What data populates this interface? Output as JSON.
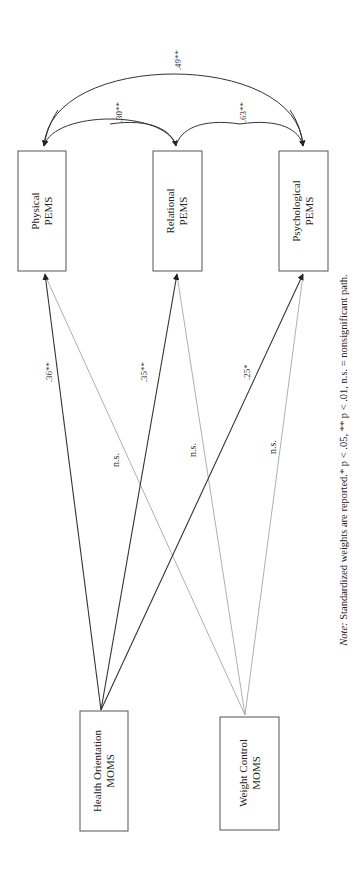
{
  "diagram": {
    "orientation": "rotated-90-ccw",
    "outcomes": [
      {
        "id": "physical",
        "line1": "Physical",
        "line2": "PEMS"
      },
      {
        "id": "relational",
        "line1": "Relational",
        "line2": "PEMS"
      },
      {
        "id": "psychological",
        "line1": "Psychological",
        "line2": "PEMS"
      }
    ],
    "predictors": [
      {
        "id": "health",
        "line1": "Health Orientation",
        "line2": "MOMS"
      },
      {
        "id": "weight",
        "line1": "Weight Control",
        "line2": "MOMS"
      }
    ],
    "paths": [
      {
        "from": "health",
        "to": "physical",
        "label": ".36**",
        "significant": true
      },
      {
        "from": "health",
        "to": "relational",
        "label": ".35**",
        "significant": true
      },
      {
        "from": "health",
        "to": "psychological",
        "label": ".25*",
        "significant": true
      },
      {
        "from": "weight",
        "to": "physical",
        "label": "n.s.",
        "significant": false
      },
      {
        "from": "weight",
        "to": "relational",
        "label": "n.s.",
        "significant": false
      },
      {
        "from": "weight",
        "to": "psychological",
        "label": "n.s.",
        "significant": false
      }
    ],
    "correlations": [
      {
        "between": [
          "physical",
          "relational"
        ],
        "label": ".30**"
      },
      {
        "between": [
          "relational",
          "psychological"
        ],
        "label": ".63**"
      },
      {
        "between": [
          "physical",
          "psychological"
        ],
        "label": ".49**"
      }
    ],
    "note": {
      "prefix": "Note:",
      "text": " Standardized weights are reported.* p < .05, ** p < .01,  n.s. = nonsignificant path."
    },
    "colors": {
      "significant_line": "#333333",
      "nonsignificant_line": "#b0b0b0",
      "box_border": "#555555"
    }
  }
}
